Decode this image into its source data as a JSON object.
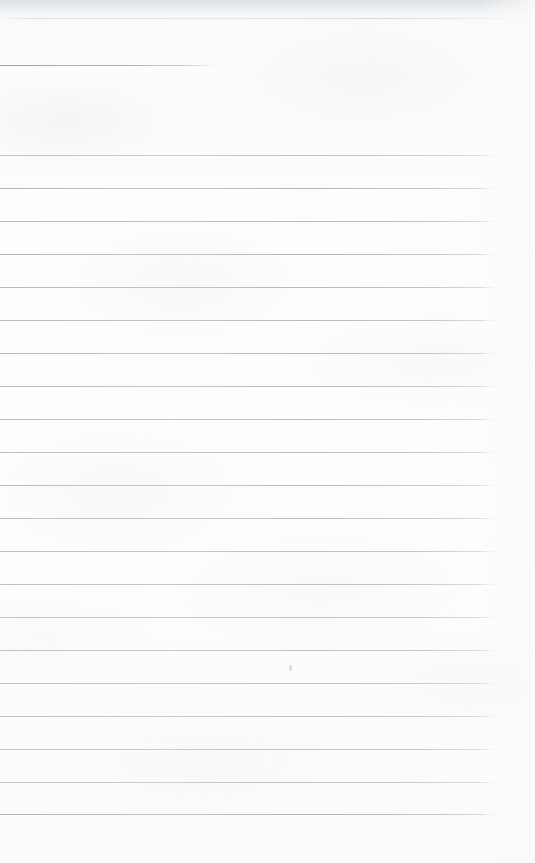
{
  "document": {
    "kind": "scanned-lined-notebook-page",
    "description": "Blank ruled notebook page, scanned",
    "text_content": "",
    "handwriting_present": "no",
    "width_px": 535,
    "height_px": 863
  },
  "page": {
    "background_color": "#fbfbfc",
    "paper_tone_top": "#f4f5f6",
    "rule_color": "#b5bac0",
    "rule_color_dark": "#a8adb4",
    "right_margin_px": 40,
    "bottom_margin_px": 49
  },
  "artifacts": {
    "scan_shadow_top": {
      "name": "top-edge-scan-shadow",
      "y": 0,
      "height": 26,
      "color": "#d6d9dc"
    },
    "crease": {
      "name": "paper-crease-line",
      "y": 18,
      "color": "#c6c9cd"
    },
    "smudge": {
      "name": "pencil-smudge",
      "x": 289,
      "y": 665,
      "width": 3,
      "height": 6
    }
  },
  "rules": {
    "short_rule": {
      "id": "rule-0-short",
      "y": 65,
      "x_start": 0,
      "x_end": 216,
      "full_width": false
    },
    "spacing_px": 33.0,
    "first_full_y": 155,
    "last_full_y": 814,
    "full_x_start": 0,
    "full_x_end": 496,
    "full_rules": [
      {
        "id": "rule-1",
        "y": 155
      },
      {
        "id": "rule-2",
        "y": 188
      },
      {
        "id": "rule-3",
        "y": 221
      },
      {
        "id": "rule-4",
        "y": 254
      },
      {
        "id": "rule-5",
        "y": 287
      },
      {
        "id": "rule-6",
        "y": 320
      },
      {
        "id": "rule-7",
        "y": 353
      },
      {
        "id": "rule-8",
        "y": 386
      },
      {
        "id": "rule-9",
        "y": 419
      },
      {
        "id": "rule-10",
        "y": 452
      },
      {
        "id": "rule-11",
        "y": 485
      },
      {
        "id": "rule-12",
        "y": 518
      },
      {
        "id": "rule-13",
        "y": 551
      },
      {
        "id": "rule-14",
        "y": 584
      },
      {
        "id": "rule-15",
        "y": 617
      },
      {
        "id": "rule-16",
        "y": 650
      },
      {
        "id": "rule-17",
        "y": 683
      },
      {
        "id": "rule-18",
        "y": 716
      },
      {
        "id": "rule-19",
        "y": 749
      },
      {
        "id": "rule-20",
        "y": 782
      },
      {
        "id": "rule-21",
        "y": 814
      }
    ]
  }
}
